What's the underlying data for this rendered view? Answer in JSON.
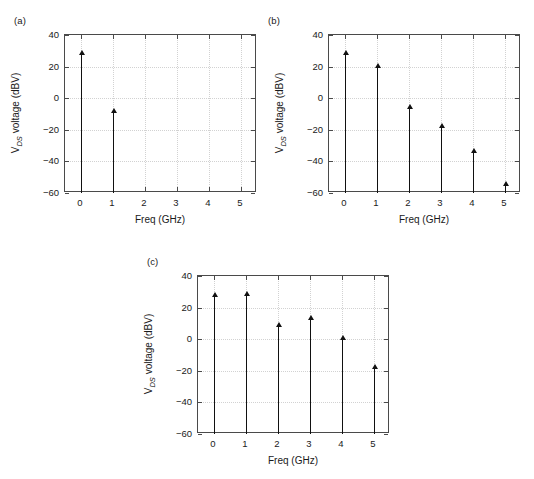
{
  "figure": {
    "panels": [
      {
        "letter": "(a)",
        "xlabel": "Freq (GHz)",
        "ylabel_main": "V",
        "ylabel_sub": "DS",
        "ylabel_rest": " voltage (dBV)",
        "xticks": [
          "0",
          "1",
          "2",
          "3",
          "4",
          "5"
        ],
        "yticks": [
          "40",
          "20",
          "0",
          "−20",
          "−40",
          "−60"
        ]
      },
      {
        "letter": "(b)",
        "xlabel": "Freq (GHz)",
        "ylabel_main": "V",
        "ylabel_sub": "DS",
        "ylabel_rest": " voltage (dBV)",
        "xticks": [
          "0",
          "1",
          "2",
          "3",
          "4",
          "5"
        ],
        "yticks": [
          "40",
          "20",
          "0",
          "−20",
          "−40",
          "−60"
        ]
      },
      {
        "letter": "(c)",
        "xlabel": "Freq (GHz)",
        "ylabel_main": "V",
        "ylabel_sub": "DS",
        "ylabel_rest": " voltage (dBV)",
        "xticks": [
          "0",
          "1",
          "2",
          "3",
          "4",
          "5"
        ],
        "yticks": [
          "40",
          "20",
          "0",
          "−20",
          "−40",
          "−60"
        ]
      }
    ]
  },
  "chart_data": [
    {
      "type": "line",
      "subtype": "stem",
      "panel": "(a)",
      "title": "",
      "xlabel": "Freq (GHz)",
      "ylabel": "V_DS voltage (dBV)",
      "x": [
        0,
        1
      ],
      "values": [
        29,
        -8
      ],
      "xlim": [
        -0.5,
        5.5
      ],
      "ylim": [
        -60,
        40
      ],
      "xticks": [
        0,
        1,
        2,
        3,
        4,
        5
      ],
      "yticks": [
        -60,
        -40,
        -20,
        0,
        20,
        40
      ],
      "grid": true,
      "legend": null,
      "baseline": -60,
      "marker": "triangle-up",
      "color": "#111111"
    },
    {
      "type": "line",
      "subtype": "stem",
      "panel": "(b)",
      "title": "",
      "xlabel": "Freq (GHz)",
      "ylabel": "V_DS voltage (dBV)",
      "x": [
        0,
        1,
        2,
        3,
        4,
        5
      ],
      "values": [
        29,
        21,
        -5,
        -17.5,
        -33,
        -54
      ],
      "xlim": [
        -0.5,
        5.5
      ],
      "ylim": [
        -60,
        40
      ],
      "xticks": [
        0,
        1,
        2,
        3,
        4,
        5
      ],
      "yticks": [
        -60,
        -40,
        -20,
        0,
        20,
        40
      ],
      "grid": true,
      "legend": null,
      "baseline": -60,
      "marker": "triangle-up",
      "color": "#111111"
    },
    {
      "type": "line",
      "subtype": "stem",
      "panel": "(c)",
      "title": "",
      "xlabel": "Freq (GHz)",
      "ylabel": "V_DS voltage (dBV)",
      "x": [
        0,
        1,
        2,
        3,
        4,
        5
      ],
      "values": [
        28.5,
        29,
        9.5,
        13.5,
        1,
        -17
      ],
      "xlim": [
        -0.5,
        5.5
      ],
      "ylim": [
        -60,
        40
      ],
      "xticks": [
        0,
        1,
        2,
        3,
        4,
        5
      ],
      "yticks": [
        -60,
        -40,
        -20,
        0,
        20,
        40
      ],
      "grid": true,
      "legend": null,
      "baseline": -60,
      "marker": "triangle-up",
      "color": "#111111"
    }
  ]
}
